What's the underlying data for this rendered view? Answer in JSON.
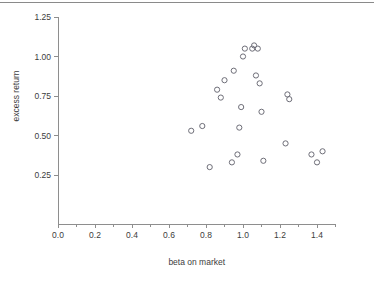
{
  "chart_data": {
    "type": "scatter",
    "title": "",
    "xlabel": "beta on market",
    "ylabel": "excess return",
    "xlim": [
      0.0,
      1.5
    ],
    "ylim": [
      0.1,
      1.25
    ],
    "grid": false,
    "legend": null,
    "xticks": [
      0.0,
      0.2,
      0.4,
      0.6,
      0.8,
      1.0,
      1.2,
      1.4
    ],
    "xtick_labels": [
      "0.0",
      "0.2",
      "0.4",
      "0.6",
      "0.8",
      "1.0",
      "1.2",
      "1.4"
    ],
    "xminor_ticks": [
      0.1,
      0.3,
      0.5,
      0.7,
      0.9,
      1.1,
      1.3,
      1.5
    ],
    "yticks": [
      0.25,
      0.5,
      0.75,
      1.0,
      1.25
    ],
    "ytick_labels": [
      "0.25",
      "0.50",
      "0.75",
      "1.00",
      "1.25"
    ],
    "marker": "open-circle",
    "marker_color": "#6e6e78",
    "points": [
      {
        "x": 0.72,
        "y": 0.53
      },
      {
        "x": 0.78,
        "y": 0.56
      },
      {
        "x": 0.82,
        "y": 0.3
      },
      {
        "x": 0.86,
        "y": 0.79
      },
      {
        "x": 0.88,
        "y": 0.74
      },
      {
        "x": 0.9,
        "y": 0.85
      },
      {
        "x": 0.94,
        "y": 0.33
      },
      {
        "x": 0.95,
        "y": 0.91
      },
      {
        "x": 0.97,
        "y": 0.38
      },
      {
        "x": 0.98,
        "y": 0.55
      },
      {
        "x": 0.99,
        "y": 0.68
      },
      {
        "x": 1.0,
        "y": 1.0
      },
      {
        "x": 1.01,
        "y": 1.05
      },
      {
        "x": 1.05,
        "y": 1.05
      },
      {
        "x": 1.06,
        "y": 1.07
      },
      {
        "x": 1.07,
        "y": 0.88
      },
      {
        "x": 1.08,
        "y": 1.05
      },
      {
        "x": 1.09,
        "y": 0.83
      },
      {
        "x": 1.1,
        "y": 0.65
      },
      {
        "x": 1.11,
        "y": 0.34
      },
      {
        "x": 1.23,
        "y": 0.45
      },
      {
        "x": 1.24,
        "y": 0.76
      },
      {
        "x": 1.25,
        "y": 0.73
      },
      {
        "x": 1.37,
        "y": 0.38
      },
      {
        "x": 1.4,
        "y": 0.33
      },
      {
        "x": 1.43,
        "y": 0.4
      }
    ]
  }
}
